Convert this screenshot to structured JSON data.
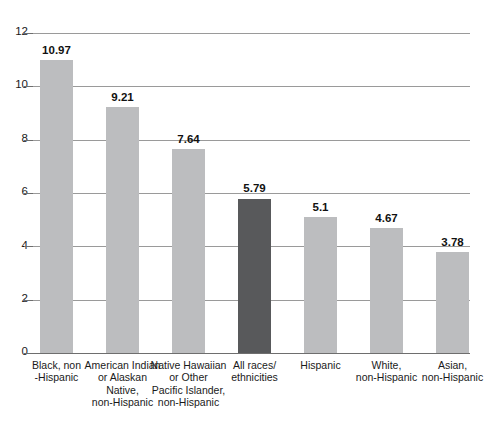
{
  "chart_data": {
    "type": "bar",
    "title": "",
    "subtitle": "",
    "xlabel": "",
    "ylabel": "",
    "ylim": [
      0,
      12
    ],
    "ytick_values": [
      0,
      2,
      4,
      6,
      8,
      10,
      12
    ],
    "ytick_labels": [
      "0",
      "2",
      "4",
      "6",
      "8",
      "10",
      "12"
    ],
    "grid": "horizontal",
    "legend": "none",
    "categories": [
      "Black, non-Hispanic",
      "American Indian or Alaskan Native, non-Hispanic",
      "Native Hawaiian or Other Pacific Islander, non-Hispanic",
      "All races/ethnicities",
      "Hispanic",
      "White, non-Hispanic",
      "Asian, non-Hispanic"
    ],
    "values": [
      10.97,
      9.21,
      7.64,
      5.79,
      5.1,
      4.67,
      3.78
    ],
    "value_labels": [
      "10.97",
      "9.21",
      "7.64",
      "5.79",
      "5.1",
      "4.67",
      "3.78"
    ],
    "bar_colors": [
      "#bcbdbf",
      "#bcbdbf",
      "#bcbdbf",
      "#bcbdbf",
      "#bcbdbf",
      "#bcbdbf",
      "#bcbdbf"
    ],
    "highlight_index": 3,
    "highlight_color": "#58595b",
    "bar_color": "#bcbdbf",
    "gridline_color": "#9a9a9a",
    "axis_color": "#6e6e6e",
    "background": "#ffffff",
    "category_label_lines": [
      [
        "Black, non",
        "-Hispanic"
      ],
      [
        "American Indian",
        "or Alaskan",
        "Native,",
        "non-Hispanic"
      ],
      [
        "Native Hawaiian",
        "or Other",
        "Pacific Islander,",
        "non-Hispanic"
      ],
      [
        "All races/",
        "ethnicities"
      ],
      [
        "Hispanic"
      ],
      [
        "White,",
        "non-Hispanic"
      ],
      [
        "Asian,",
        "non-Hispanic"
      ]
    ]
  }
}
